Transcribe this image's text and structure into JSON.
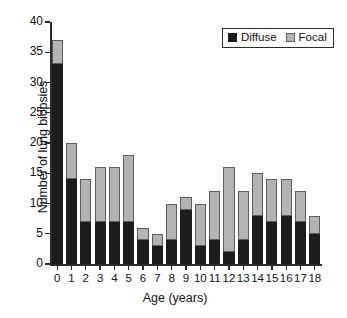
{
  "chart_data": {
    "type": "bar",
    "subtype": "stacked-vertical",
    "title": "",
    "xlabel": "Age (years)",
    "ylabel": "Number of lung biopsies",
    "categories": [
      "0",
      "1",
      "2",
      "3",
      "4",
      "5",
      "6",
      "7",
      "8",
      "9",
      "10",
      "11",
      "12",
      "13",
      "14",
      "15",
      "16",
      "17",
      "18"
    ],
    "series": [
      {
        "name": "Diffuse",
        "color": "#1c1c1c",
        "values": [
          33,
          14,
          7,
          7,
          7,
          7,
          4,
          3,
          4,
          9,
          3,
          4,
          2,
          4,
          8,
          7,
          8,
          7,
          5
        ]
      },
      {
        "name": "Focal",
        "color": "#b3b3b3",
        "values": [
          4,
          6,
          7,
          9,
          9,
          11,
          2,
          2,
          6,
          2,
          7,
          8,
          14,
          8,
          7,
          7,
          6,
          5,
          3
        ]
      }
    ],
    "totals": [
      37,
      20,
      14,
      16,
      16,
      18,
      6,
      5,
      10,
      11,
      10,
      12,
      16,
      12,
      15,
      14,
      14,
      12,
      8
    ],
    "ylim": [
      0,
      40
    ],
    "yticks": [
      0,
      5,
      10,
      15,
      20,
      25,
      30,
      35,
      40
    ],
    "ytick_labels": [
      "0",
      "5",
      "10",
      "15",
      "20",
      "25",
      "30",
      "35",
      "40"
    ],
    "grid": false,
    "legend": {
      "position": "top-right",
      "entries": [
        {
          "label": "Diffuse",
          "color": "#1c1c1c"
        },
        {
          "label": "Focal",
          "color": "#b3b3b3"
        }
      ]
    }
  }
}
